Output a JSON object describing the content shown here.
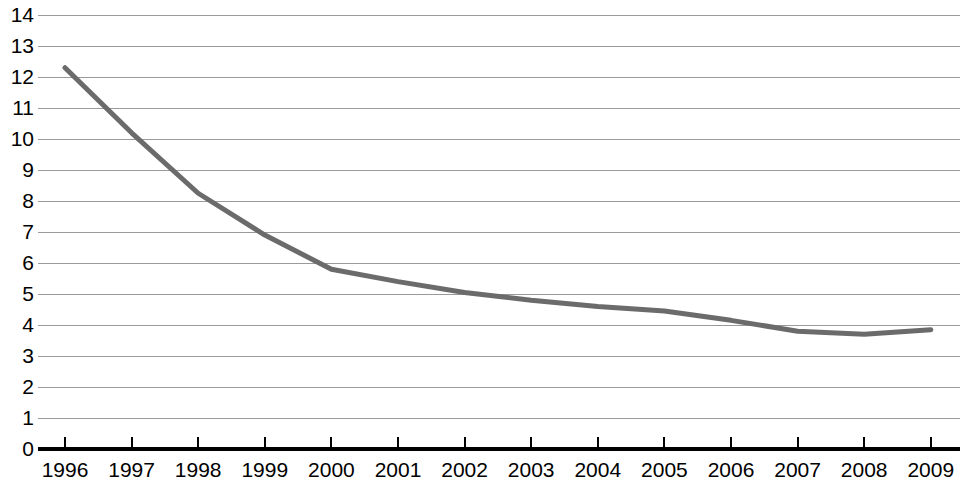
{
  "chart_data": {
    "type": "line",
    "title": "",
    "subtitle": "",
    "xlabel": "",
    "ylabel": "",
    "grid": true,
    "legend": false,
    "legend_position": "none",
    "line_color": "#6b6b6b",
    "grid_color": "#9a9a9a",
    "axis_color": "#000000",
    "text_color": "#000000",
    "background_color": "#ffffff",
    "xlim": [
      1996,
      2009
    ],
    "ylim": [
      0,
      14
    ],
    "y_ticks": [
      0,
      1,
      2,
      3,
      4,
      5,
      6,
      7,
      8,
      9,
      10,
      11,
      12,
      13,
      14
    ],
    "y_tick_labels": [
      "0",
      "1",
      "2",
      "3",
      "4",
      "5",
      "6",
      "7",
      "8",
      "9",
      "10",
      "11",
      "12",
      "13",
      "14"
    ],
    "categories": [
      "1996",
      "1997",
      "1998",
      "1999",
      "2000",
      "2001",
      "2002",
      "2003",
      "2004",
      "2005",
      "2006",
      "2007",
      "2008",
      "2009"
    ],
    "x": [
      1996,
      1997,
      1998,
      1999,
      2000,
      2001,
      2002,
      2003,
      2004,
      2005,
      2006,
      2007,
      2008,
      2009
    ],
    "values": [
      12.3,
      10.2,
      8.25,
      6.9,
      5.8,
      5.4,
      5.05,
      4.8,
      4.6,
      4.45,
      4.15,
      3.8,
      3.7,
      3.85
    ],
    "series": [
      {
        "name": "series-1",
        "color": "#6b6b6b",
        "line_width": 5,
        "values": [
          12.3,
          10.2,
          8.25,
          6.9,
          5.8,
          5.4,
          5.05,
          4.8,
          4.6,
          4.45,
          4.15,
          3.8,
          3.7,
          3.85
        ]
      }
    ],
    "annotations": []
  }
}
